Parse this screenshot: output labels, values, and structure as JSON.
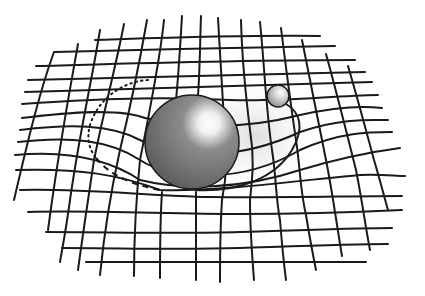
{
  "illustration": {
    "subject": "spacetime curvature grid with large mass and orbiting small body",
    "colors": {
      "background": "#ffffff",
      "grid_line": "#1a1a1a",
      "large_sphere_base": "#6b6b6b",
      "large_sphere_highlight": "#ffffff",
      "small_sphere_base": "#8a8a8a",
      "shadow": "#e4e4e4"
    },
    "large_sphere": {
      "cx": 192,
      "cy": 142,
      "r": 47
    },
    "small_sphere": {
      "cx": 278,
      "cy": 96,
      "r": 11
    }
  }
}
